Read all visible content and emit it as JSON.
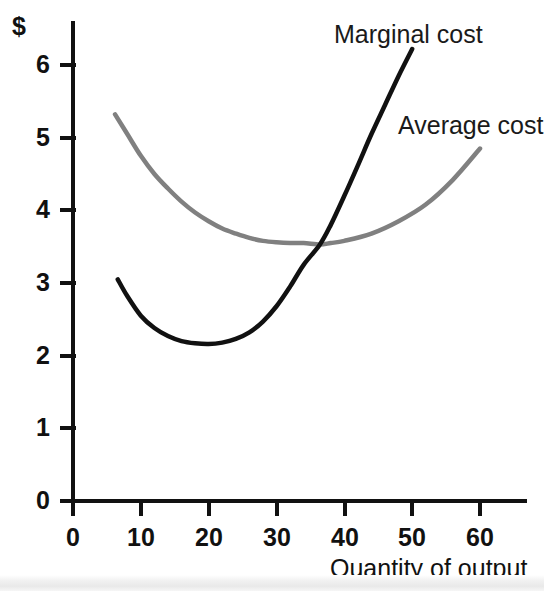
{
  "chart_data": {
    "type": "line",
    "title": "",
    "subtitle": "",
    "xlabel": "Quantity of output",
    "ylabel": "$",
    "xlim": [
      0,
      64
    ],
    "ylim": [
      0,
      6.4
    ],
    "xticks": [
      "0",
      "10",
      "20",
      "30",
      "40",
      "50",
      "60"
    ],
    "xtick_values": [
      0,
      10,
      20,
      30,
      40,
      50,
      60
    ],
    "yticks": [
      "0",
      "1",
      "2",
      "3",
      "4",
      "5",
      "6"
    ],
    "ytick_values": [
      0,
      1,
      2,
      3,
      4,
      5,
      6
    ],
    "grid": false,
    "legend_position": "inline-annotations",
    "annotations": [
      {
        "text": "Marginal cost",
        "x": 38.5,
        "y": 6.55
      },
      {
        "text": "Average cost",
        "x": 48.0,
        "y": 5.05
      }
    ],
    "series": [
      {
        "name": "Marginal cost",
        "color": "#111111",
        "linewidth": 4,
        "x": [
          6.6,
          8,
          10,
          12,
          14,
          16,
          18,
          20,
          22,
          24,
          26,
          28,
          30,
          32,
          34,
          36.4,
          38,
          40,
          42,
          44,
          46,
          48,
          50
        ],
        "values": [
          3.05,
          2.82,
          2.55,
          2.38,
          2.27,
          2.2,
          2.17,
          2.16,
          2.18,
          2.23,
          2.32,
          2.47,
          2.68,
          2.95,
          3.25,
          3.53,
          3.8,
          4.2,
          4.62,
          5.05,
          5.45,
          5.85,
          6.22
        ]
      },
      {
        "name": "Average cost",
        "color": "#808080",
        "linewidth": 4,
        "x": [
          6.2,
          8,
          10,
          12,
          14,
          16,
          18,
          20,
          22,
          24,
          26,
          28,
          30,
          32,
          34,
          36.4,
          38,
          40,
          44,
          48,
          52,
          56,
          60
        ],
        "values": [
          5.32,
          5.05,
          4.75,
          4.5,
          4.3,
          4.12,
          3.97,
          3.85,
          3.75,
          3.68,
          3.62,
          3.58,
          3.56,
          3.55,
          3.55,
          3.53,
          3.55,
          3.58,
          3.68,
          3.85,
          4.08,
          4.42,
          4.85
        ]
      }
    ],
    "intersection": {
      "x": 36.4,
      "y": 3.53
    },
    "marginal_cost_minimum": {
      "x": 20,
      "y": 2.16
    },
    "average_cost_minimum": {
      "x": 33,
      "y": 3.55
    }
  },
  "axes": {
    "y_unit_label": "$",
    "x_axis_title": "Quantity of output"
  }
}
